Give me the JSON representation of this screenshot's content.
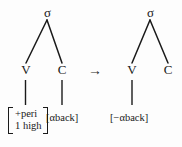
{
  "figure": {
    "type": "phonological-rule-tree-diagram",
    "background_color": "#fdfdfd",
    "ink_color": "#1a1a1a",
    "operator": "→",
    "operator_name": "rewrite-arrow"
  },
  "input_tree": {
    "root_label": "σ",
    "daughters": [
      {
        "label": "V",
        "position": "left"
      },
      {
        "label": "C",
        "position": "right"
      }
    ],
    "feature_bundles": [
      {
        "attached_to": "V",
        "kind": "matrix",
        "rows": [
          "+peri",
          "1 high"
        ]
      },
      {
        "attached_to": "C",
        "kind": "simple",
        "text": "[αback]"
      }
    ]
  },
  "output_tree": {
    "root_label": "σ",
    "daughters": [
      {
        "label": "V",
        "position": "left"
      },
      {
        "label": "C",
        "position": "right"
      }
    ],
    "feature_bundles": [
      {
        "attached_to": "V",
        "kind": "simple",
        "text": "[−αback]"
      }
    ]
  }
}
